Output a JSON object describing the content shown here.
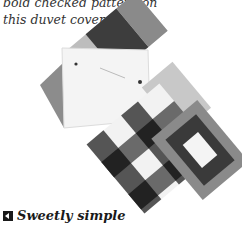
{
  "caption": {
    "lines": [
      "bold checked pattern on",
      "this duvet cover."
    ]
  },
  "image": {
    "subject": "fabric-swatches",
    "colors": {
      "dark": "#3a3a3a",
      "mid": "#7a7a7a",
      "light": "#bdbdbd",
      "white": "#f4f4f4"
    }
  },
  "subhead": {
    "icon": "box-arrow-icon",
    "label": "Sweetly simple"
  }
}
